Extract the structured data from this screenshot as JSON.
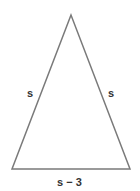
{
  "diagram": {
    "type": "isosceles-triangle",
    "vertices": {
      "apex": [
        71,
        15
      ],
      "bottom_left": [
        12,
        169
      ],
      "bottom_right": [
        130,
        169
      ]
    },
    "stroke_color": "#7a7a7a",
    "stroke_width": 1.5,
    "labels": {
      "left_side": "s",
      "right_side": "s",
      "base": "s − 3"
    }
  }
}
